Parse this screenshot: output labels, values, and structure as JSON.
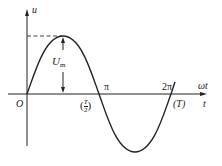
{
  "diagram": {
    "type": "sine-waveform",
    "labels": {
      "y_axis": "u",
      "x_axis_top": "ωt",
      "x_axis_bottom": "t",
      "origin": "O",
      "amplitude": "U",
      "amplitude_sub": "m",
      "pi": "π",
      "half_period": "(T/2)",
      "half_period_num": "T",
      "half_period_den": "2",
      "two_pi": "2π",
      "period": "(T)"
    },
    "colors": {
      "stroke": "#222222",
      "background": "#ffffff"
    }
  }
}
